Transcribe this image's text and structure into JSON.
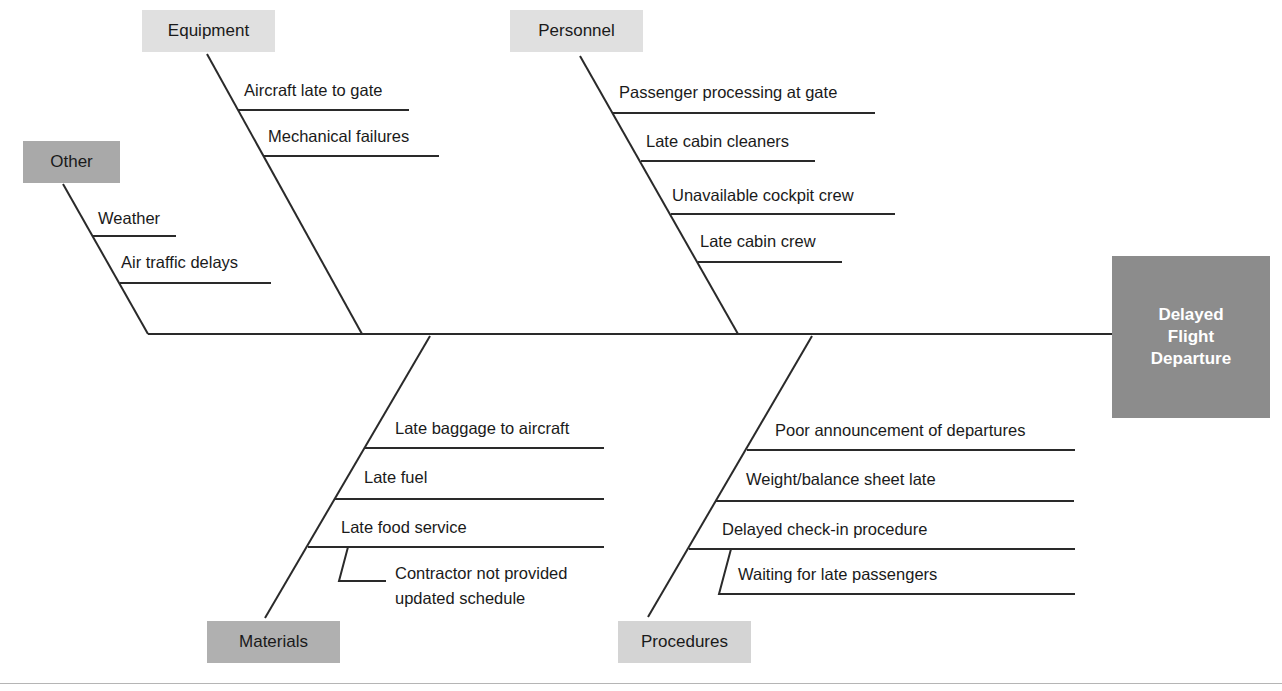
{
  "diagram": {
    "type": "fishbone",
    "effect": {
      "lines": [
        "Delayed",
        "Flight",
        "Departure"
      ],
      "color": "#8c8c8c"
    },
    "categories": [
      {
        "label": "Other",
        "position": "top",
        "color": "#a9a9a9",
        "causes": [
          "Weather",
          "Air traffic delays"
        ]
      },
      {
        "label": "Equipment",
        "position": "top",
        "color": "#e0e0e0",
        "causes": [
          "Aircraft late to gate",
          "Mechanical failures"
        ]
      },
      {
        "label": "Personnel",
        "position": "top",
        "color": "#e0e0e0",
        "causes": [
          "Passenger processing at gate",
          "Late cabin cleaners",
          "Unavailable cockpit crew",
          "Late cabin crew"
        ]
      },
      {
        "label": "Materials",
        "position": "bottom",
        "color": "#b0b0b0",
        "causes": [
          "Late baggage to aircraft",
          "Late fuel",
          "Late food service"
        ],
        "sub_causes": {
          "Late food service": [
            "Contractor not provided",
            "updated schedule"
          ]
        }
      },
      {
        "label": "Procedures",
        "position": "bottom",
        "color": "#d4d4d4",
        "causes": [
          "Poor announcement of departures",
          "Weight/balance sheet late",
          "Delayed check-in procedure"
        ],
        "sub_causes": {
          "Delayed check-in procedure": [
            "Waiting for late passengers"
          ]
        }
      }
    ]
  }
}
